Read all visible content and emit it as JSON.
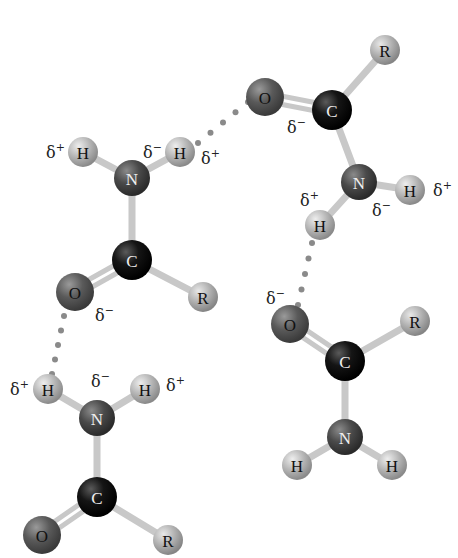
{
  "diagram": {
    "title": "",
    "colors": {
      "carbon": "#151515",
      "nitrogen": "#4a4a4a",
      "oxygen": "#5a5a5a",
      "hydrogen": "#b5b5b5",
      "r_group": "#b0b0b0",
      "bond": "#c8c8c8",
      "hbond_dots": "#8a8a8a",
      "label_dark": "#111111",
      "label_light": "#f0f0f0"
    },
    "atom_labels": {
      "C": "C",
      "N": "N",
      "O": "O",
      "H": "H",
      "R": "R"
    },
    "charges": {
      "delta": "δ",
      "plus": "+",
      "minus": "−"
    },
    "molecules": [
      {
        "id": "top-left",
        "atoms": [
          {
            "el": "H",
            "x": 83,
            "y": 152
          },
          {
            "el": "H",
            "x": 180,
            "y": 152
          },
          {
            "el": "N",
            "x": 132,
            "y": 178
          },
          {
            "el": "C",
            "x": 132,
            "y": 260
          },
          {
            "el": "O",
            "x": 75,
            "y": 292
          },
          {
            "el": "R",
            "x": 203,
            "y": 297
          }
        ],
        "charge_labels": [
          {
            "sign": "+",
            "x": 46,
            "y": 152
          },
          {
            "sign": "−",
            "x": 143,
            "y": 152
          },
          {
            "sign": "+",
            "x": 201,
            "y": 158
          },
          {
            "sign": "−",
            "x": 95,
            "y": 315
          }
        ]
      },
      {
        "id": "top-right",
        "atoms": [
          {
            "el": "O",
            "x": 265,
            "y": 97
          },
          {
            "el": "C",
            "x": 332,
            "y": 110
          },
          {
            "el": "R",
            "x": 385,
            "y": 50
          },
          {
            "el": "N",
            "x": 359,
            "y": 182
          },
          {
            "el": "H",
            "x": 320,
            "y": 225
          },
          {
            "el": "H",
            "x": 410,
            "y": 190
          }
        ],
        "charge_labels": [
          {
            "sign": "−",
            "x": 287,
            "y": 127
          },
          {
            "sign": "+",
            "x": 300,
            "y": 200
          },
          {
            "sign": "−",
            "x": 372,
            "y": 210
          },
          {
            "sign": "+",
            "x": 433,
            "y": 190
          }
        ]
      },
      {
        "id": "bottom-left",
        "atoms": [
          {
            "el": "H",
            "x": 48,
            "y": 389
          },
          {
            "el": "H",
            "x": 145,
            "y": 389
          },
          {
            "el": "N",
            "x": 97,
            "y": 418
          },
          {
            "el": "C",
            "x": 97,
            "y": 497
          },
          {
            "el": "O",
            "x": 42,
            "y": 535
          },
          {
            "el": "R",
            "x": 168,
            "y": 540
          }
        ],
        "charge_labels": [
          {
            "sign": "+",
            "x": 10,
            "y": 389
          },
          {
            "sign": "−",
            "x": 91,
            "y": 381
          },
          {
            "sign": "+",
            "x": 166,
            "y": 385
          }
        ]
      },
      {
        "id": "bottom-right",
        "atoms": [
          {
            "el": "O",
            "x": 290,
            "y": 324
          },
          {
            "el": "C",
            "x": 345,
            "y": 361
          },
          {
            "el": "R",
            "x": 415,
            "y": 321
          },
          {
            "el": "N",
            "x": 345,
            "y": 437
          },
          {
            "el": "H",
            "x": 297,
            "y": 465
          },
          {
            "el": "H",
            "x": 392,
            "y": 465
          }
        ],
        "charge_labels": [
          {
            "sign": "−",
            "x": 266,
            "y": 298
          }
        ]
      }
    ],
    "bonds": [
      {
        "m": 0,
        "a": 0,
        "b": 2,
        "order": 1
      },
      {
        "m": 0,
        "a": 1,
        "b": 2,
        "order": 1
      },
      {
        "m": 0,
        "a": 2,
        "b": 3,
        "order": 1
      },
      {
        "m": 0,
        "a": 3,
        "b": 4,
        "order": 2
      },
      {
        "m": 0,
        "a": 3,
        "b": 5,
        "order": 1
      },
      {
        "m": 1,
        "a": 0,
        "b": 1,
        "order": 2
      },
      {
        "m": 1,
        "a": 1,
        "b": 2,
        "order": 1
      },
      {
        "m": 1,
        "a": 1,
        "b": 3,
        "order": 1
      },
      {
        "m": 1,
        "a": 3,
        "b": 4,
        "order": 1
      },
      {
        "m": 1,
        "a": 3,
        "b": 5,
        "order": 1
      },
      {
        "m": 2,
        "a": 0,
        "b": 2,
        "order": 1
      },
      {
        "m": 2,
        "a": 1,
        "b": 2,
        "order": 1
      },
      {
        "m": 2,
        "a": 2,
        "b": 3,
        "order": 1
      },
      {
        "m": 2,
        "a": 3,
        "b": 4,
        "order": 2
      },
      {
        "m": 2,
        "a": 3,
        "b": 5,
        "order": 1
      },
      {
        "m": 3,
        "a": 0,
        "b": 1,
        "order": 2
      },
      {
        "m": 3,
        "a": 1,
        "b": 2,
        "order": 1
      },
      {
        "m": 3,
        "a": 1,
        "b": 3,
        "order": 1
      },
      {
        "m": 3,
        "a": 3,
        "b": 4,
        "order": 1
      },
      {
        "m": 3,
        "a": 3,
        "b": 5,
        "order": 1
      }
    ],
    "hydrogen_bonds": [
      {
        "from": [
          198,
          143
        ],
        "to": [
          248,
          102
        ],
        "dots": 5
      },
      {
        "from": [
          64,
          316
        ],
        "to": [
          52,
          374
        ],
        "dots": 5
      },
      {
        "from": [
          312,
          243
        ],
        "to": [
          298,
          305
        ],
        "dots": 5
      }
    ]
  }
}
